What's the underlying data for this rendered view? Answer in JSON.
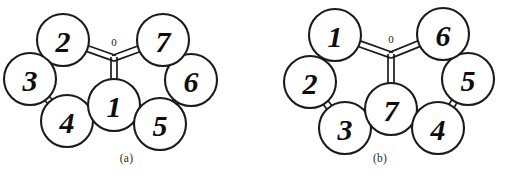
{
  "figure": {
    "background_color": "#ffffff",
    "line_color": "#1a1a1a",
    "node_fill_color": "#ffffff",
    "label_color": "#0d0d0d",
    "center_label": "0"
  },
  "panels": [
    {
      "id": "a",
      "caption": "(a)",
      "center_label": "0",
      "nodes": [
        {
          "label": "2",
          "cx": 63,
          "cy": 40,
          "r": 26
        },
        {
          "label": "3",
          "cx": 30,
          "cy": 79,
          "r": 26
        },
        {
          "label": "4",
          "cx": 67,
          "cy": 121,
          "r": 26
        },
        {
          "label": "1",
          "cx": 114,
          "cy": 105,
          "r": 26
        },
        {
          "label": "5",
          "cx": 160,
          "cy": 124,
          "r": 26
        },
        {
          "label": "6",
          "cx": 191,
          "cy": 80,
          "r": 26
        },
        {
          "label": "7",
          "cx": 163,
          "cy": 40,
          "r": 26
        }
      ],
      "junction": {
        "x": 114,
        "y": 58
      },
      "bonds": [
        {
          "from": "2",
          "to": "3"
        },
        {
          "from": "3",
          "to": "4"
        },
        {
          "from": "4",
          "to": "1"
        },
        {
          "from": "1",
          "to": "5"
        },
        {
          "from": "5",
          "to": "6"
        },
        {
          "from": "6",
          "to": "7"
        },
        {
          "from": "2",
          "to": "junction"
        },
        {
          "from": "7",
          "to": "junction"
        },
        {
          "from": "1",
          "to": "junction"
        }
      ]
    },
    {
      "id": "b",
      "caption": "(b)",
      "center_label": "0",
      "nodes": [
        {
          "label": "1",
          "cx": 82,
          "cy": 35,
          "r": 26
        },
        {
          "label": "2",
          "cx": 57,
          "cy": 82,
          "r": 26
        },
        {
          "label": "3",
          "cx": 92,
          "cy": 128,
          "r": 26
        },
        {
          "label": "7",
          "cx": 138,
          "cy": 109,
          "r": 26
        },
        {
          "label": "4",
          "cx": 185,
          "cy": 128,
          "r": 26
        },
        {
          "label": "5",
          "cx": 215,
          "cy": 79,
          "r": 26
        },
        {
          "label": "6",
          "cx": 190,
          "cy": 34,
          "r": 26
        }
      ],
      "junction": {
        "x": 138,
        "y": 55
      },
      "bonds": [
        {
          "from": "1",
          "to": "2"
        },
        {
          "from": "2",
          "to": "3"
        },
        {
          "from": "3",
          "to": "7"
        },
        {
          "from": "7",
          "to": "4"
        },
        {
          "from": "4",
          "to": "5"
        },
        {
          "from": "5",
          "to": "6"
        },
        {
          "from": "1",
          "to": "junction"
        },
        {
          "from": "6",
          "to": "junction"
        },
        {
          "from": "7",
          "to": "junction"
        }
      ]
    }
  ]
}
